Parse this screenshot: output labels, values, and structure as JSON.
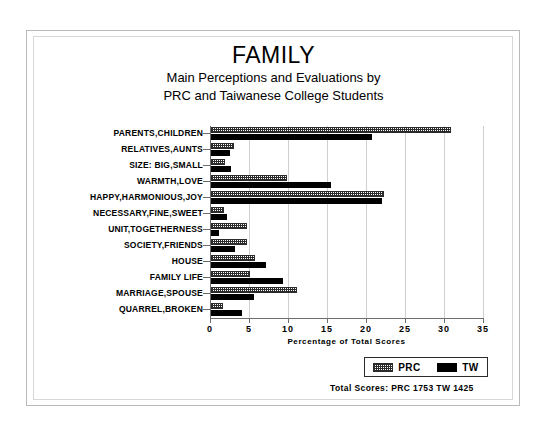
{
  "figure": {
    "title": "FAMILY",
    "subtitle_line1": "Main Perceptions and Evaluations by",
    "subtitle_line2": "PRC and Taiwanese College Students",
    "totals_note": "Total Scores:  PRC 1753   TW 1425"
  },
  "legend": {
    "position": "bottom-right",
    "entries": [
      {
        "label": "PRC",
        "swatch": "hatched"
      },
      {
        "label": "TW",
        "swatch": "solid-black"
      }
    ]
  },
  "colors": {
    "prc_bar": "#2b2b2b",
    "tw_bar": "#000000",
    "axis": "#6d6d6d",
    "gridline": "#cfcfcf",
    "frame": "#b9b9b9",
    "background": "#ffffff"
  },
  "chart_data": {
    "type": "bar",
    "orientation": "horizontal",
    "title": "FAMILY",
    "subtitle": "Main Perceptions and Evaluations by PRC and Taiwanese College Students",
    "xlabel": "Percentage of Total Scores",
    "ylabel": "",
    "xlim": [
      0,
      35
    ],
    "xticks": [
      0,
      5,
      10,
      15,
      20,
      25,
      30,
      35
    ],
    "grid": true,
    "legend_position": "bottom-right",
    "categories": [
      "PARENTS,CHILDREN",
      "RELATIVES,AUNTS",
      "SIZE: BIG,SMALL",
      "WARMTH,LOVE",
      "HAPPY,HARMONIOUS,JOY",
      "NECESSARY,FINE,SWEET",
      "UNIT,TOGETHERNESS",
      "SOCIETY,FRIENDS",
      "HOUSE",
      "FAMILY LIFE",
      "MARRIAGE,SPOUSE",
      "QUARREL,BROKEN"
    ],
    "series": [
      {
        "name": "PRC",
        "values": [
          30.8,
          3.0,
          1.8,
          9.8,
          22.2,
          1.7,
          4.6,
          4.6,
          5.6,
          5.0,
          11.0,
          1.6
        ]
      },
      {
        "name": "TW",
        "values": [
          20.7,
          2.4,
          2.6,
          15.4,
          21.9,
          2.0,
          1.0,
          3.1,
          7.1,
          9.2,
          5.5,
          4.0
        ]
      }
    ],
    "annotations": {
      "total_scores_prc": 1753,
      "total_scores_tw": 1425
    }
  }
}
